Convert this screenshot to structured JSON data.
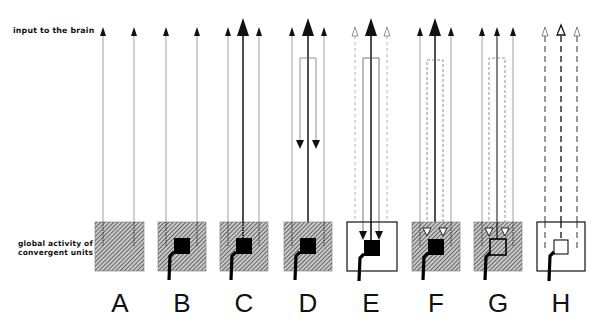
{
  "labels": {
    "input": "input to the brain",
    "global_line1": "global activity of",
    "global_line2": "convergent units"
  },
  "colors": {
    "ink": "#111111",
    "hatch_bg": "#8a8a8a",
    "thin_line": "#999999",
    "paper": "#ffffff"
  },
  "panels": [
    {
      "letter": "A",
      "box": "hatched",
      "core": "none",
      "center_arrow": "none",
      "side_arrows": "solid",
      "feedback": "none"
    },
    {
      "letter": "B",
      "box": "hatched",
      "core": "filled",
      "center_arrow": "none",
      "side_arrows": "solid",
      "feedback": "none"
    },
    {
      "letter": "C",
      "box": "hatched",
      "core": "filled",
      "center_arrow": "large-solid",
      "side_arrows": "solid",
      "feedback": "none"
    },
    {
      "letter": "D",
      "box": "hatched",
      "core": "filled",
      "center_arrow": "large-solid",
      "side_arrows": "solid",
      "feedback": "solid-loop-short"
    },
    {
      "letter": "E",
      "box": "white",
      "core": "filled",
      "center_arrow": "large-solid",
      "side_arrows": "dashed-open",
      "feedback": "solid-loop-long"
    },
    {
      "letter": "F",
      "box": "hatched",
      "core": "filled",
      "center_arrow": "large-solid",
      "side_arrows": "solid",
      "feedback": "dashed-loop-open-heads"
    },
    {
      "letter": "G",
      "box": "hatched",
      "core": "open",
      "center_arrow": "small-solid",
      "side_arrows": "solid",
      "feedback": "dashed-loop-open-heads"
    },
    {
      "letter": "H",
      "box": "white",
      "core": "open",
      "center_arrow": "dashed-open",
      "side_arrows": "dashed-open",
      "feedback": "none"
    }
  ]
}
